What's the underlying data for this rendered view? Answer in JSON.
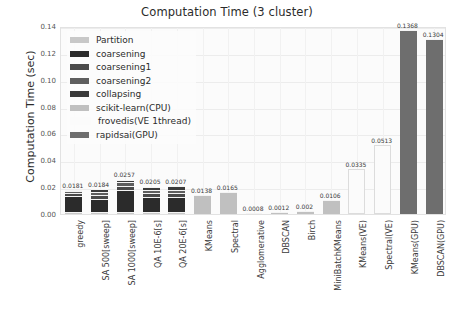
{
  "chart_data": {
    "type": "bar",
    "title": "Computation Time (3 cluster)",
    "xlabel": "",
    "ylabel": "Computation Time (sec)",
    "ylim": [
      0.0,
      0.14
    ],
    "yticks": [
      "0.00",
      "0.02",
      "0.04",
      "0.06",
      "0.08",
      "0.10",
      "0.12",
      "0.14"
    ],
    "ytick_values": [
      0.0,
      0.02,
      0.04,
      0.06,
      0.08,
      0.1,
      0.12,
      0.14
    ],
    "grid": true,
    "legend_position": "upper left",
    "stacked": true,
    "categories": [
      "greedy",
      "SA 500[sweep]",
      "SA 1000[sweep]",
      "QA 10E-6[s]",
      "QA 20E-6[s]",
      "KMeans",
      "Spectral",
      "Agglomerative",
      "DBSCAN",
      "Birch",
      "MiniBatchKMeans",
      "KMeans(VE)",
      "Spectral(VE)",
      "KMeans(GPU)",
      "DBSCAN(GPU)"
    ],
    "totals": [
      0.0181,
      0.0184,
      0.0257,
      0.0205,
      0.0207,
      0.0138,
      0.0165,
      0.0008,
      0.0012,
      0.002,
      0.0106,
      0.0335,
      0.0513,
      0.1368,
      0.1304
    ],
    "total_labels": [
      "0.0181",
      "0.0184",
      "0.0257",
      "0.0205",
      "0.0207",
      "0.0138",
      "0.0165",
      "0.0008",
      "0.0012",
      "0.002",
      "0.0106",
      "0.0335",
      "0.0513",
      "0.1368",
      "0.1304"
    ],
    "series": [
      {
        "name": "Partition",
        "color": "#c8c8c8",
        "values": [
          0.0012,
          0.0012,
          0.0014,
          0.0013,
          0.0013,
          0,
          0,
          0,
          0,
          0,
          0,
          0,
          0,
          0,
          0
        ]
      },
      {
        "name": "coarsening",
        "color": "#2b2b2b",
        "values": [
          0.0122,
          0.0101,
          0.0165,
          0.0112,
          0.0114,
          0,
          0,
          0,
          0,
          0,
          0,
          0,
          0,
          0,
          0
        ]
      },
      {
        "name": "coarsening1",
        "color": "#4a4a4a",
        "values": [
          0.0019,
          0.0027,
          0.0032,
          0.0028,
          0.0028,
          0,
          0,
          0,
          0,
          0,
          0,
          0,
          0,
          0,
          0
        ]
      },
      {
        "name": "coarsening2",
        "color": "#5e5e5e",
        "values": [
          0.0016,
          0.0023,
          0.0026,
          0.0026,
          0.0026,
          0,
          0,
          0,
          0,
          0,
          0,
          0,
          0,
          0,
          0
        ]
      },
      {
        "name": "collapsing",
        "color": "#3a3a3a",
        "values": [
          0.0012,
          0.0021,
          0.002,
          0.0026,
          0.0026,
          0,
          0,
          0,
          0,
          0,
          0,
          0,
          0,
          0,
          0
        ]
      },
      {
        "name": "scikit-learn(CPU)",
        "color": "#c0c0c0",
        "values": [
          0,
          0,
          0,
          0,
          0,
          0.0138,
          0.0165,
          0.0008,
          0.0012,
          0.002,
          0.0106,
          0,
          0,
          0,
          0
        ]
      },
      {
        "name": "frovedis(VE 1thread)",
        "color": "#fbfbfb",
        "values": [
          0,
          0,
          0,
          0,
          0,
          0,
          0,
          0,
          0,
          0,
          0,
          0.0335,
          0.0513,
          0,
          0
        ]
      },
      {
        "name": "rapidsai(GPU)",
        "color": "#6e6e6e",
        "values": [
          0,
          0,
          0,
          0,
          0,
          0,
          0,
          0,
          0,
          0,
          0,
          0,
          0,
          0.1368,
          0.1304
        ]
      }
    ]
  },
  "legend": {
    "items": [
      {
        "label": "Partition",
        "color": "#c8c8c8"
      },
      {
        "label": "coarsening",
        "color": "#2b2b2b"
      },
      {
        "label": "coarsening1",
        "color": "#4a4a4a"
      },
      {
        "label": "coarsening2",
        "color": "#5e5e5e"
      },
      {
        "label": "collapsing",
        "color": "#3a3a3a"
      },
      {
        "label": "scikit-learn(CPU)",
        "color": "#c0c0c0"
      },
      {
        "label": "frovedis(VE 1thread)",
        "color": "#fbfbfb"
      },
      {
        "label": "rapidsai(GPU)",
        "color": "#6e6e6e"
      }
    ]
  }
}
